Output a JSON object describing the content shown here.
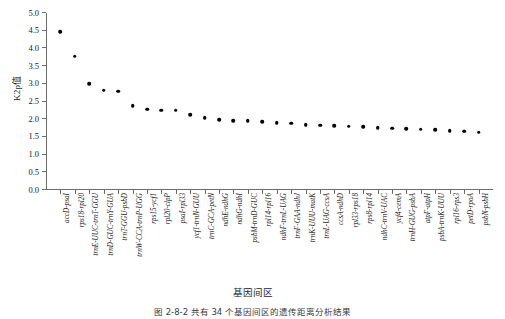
{
  "figure": {
    "caption": "图 2-8-2   共有 34 个基因间区的遗传距离分析结果"
  },
  "chart_data": {
    "type": "scatter",
    "title": "",
    "xlabel": "基因间区",
    "ylabel": "K2p值",
    "ylim": [
      0.0,
      5.0
    ],
    "ytick_labels": [
      "0.0",
      "0.5",
      "1.0",
      "1.5",
      "2.0",
      "2.5",
      "3.0",
      "3.5",
      "4.0",
      "4.5",
      "5.0"
    ],
    "ytick_values": [
      0.0,
      0.5,
      1.0,
      1.5,
      2.0,
      2.5,
      3.0,
      3.5,
      4.0,
      4.5,
      5.0
    ],
    "grid": false,
    "legend": null,
    "categories": [
      "accD-psaI",
      "rps18-rpl20",
      "trnE-UUC-trnT-GGU",
      "trnD-GUC-trnY-GUA",
      "trnT-GGU-psbD",
      "trnW-CCA-trnP-UGG",
      "rps15-ycf1",
      "rpl20-clpP",
      "psaI-rpl33",
      "ycf1-trnN-GUU",
      "trnC-GCA-petN",
      "ndhE-ndhG",
      "ndhG-ndhI",
      "psbM-trnD-GUC",
      "rpl14-rpl16",
      "ndhF-trnL-UAG",
      "trnF-GAA-ndhJ",
      "trnK-UUU-matK",
      "trnL-UAG-ccsA",
      "ccsA-ndhD",
      "rpl33-rps18",
      "rps8-rpl14",
      "ndhC-trnV-UAC",
      "ycf4-cemA",
      "trnH-GUG-psbA",
      "atpF-atpH",
      "psbA-trnK-UUU",
      "rpl16-rps3",
      "petD-rpoA",
      "psbN-psbH"
    ],
    "values": [
      4.47,
      3.78,
      3.0,
      2.82,
      2.79,
      2.38,
      2.28,
      2.25,
      2.25,
      2.13,
      2.04,
      1.99,
      1.96,
      1.95,
      1.92,
      1.9,
      1.88,
      1.85,
      1.83,
      1.82,
      1.8,
      1.78,
      1.76,
      1.74,
      1.73,
      1.72,
      1.7,
      1.68,
      1.66,
      1.63
    ]
  }
}
